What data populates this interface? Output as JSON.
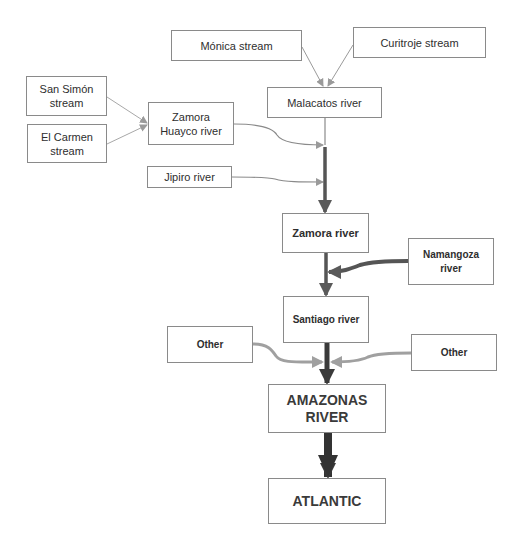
{
  "diagram": {
    "type": "flowchart",
    "title": "",
    "colors": {
      "box_border": "#8a8a8a",
      "thin_arrow": "#9a9a9a",
      "medium_arrow": "#5a5a5a",
      "dark_arrow": "#3a3a3a",
      "light_thick_arrow": "#a0a0a0",
      "text": "#2e2e2e"
    },
    "nodes": {
      "monica": {
        "label": "Mónica stream"
      },
      "curitroje": {
        "label": "Curitroje stream"
      },
      "malacatos": {
        "label": "Malacatos river"
      },
      "san_simon": {
        "label": "San Simón\nstream"
      },
      "el_carmen": {
        "label": "El Carmen\nstream"
      },
      "zamora_huayco": {
        "label": "Zamora\nHuayco river"
      },
      "jipiro": {
        "label": "Jipiro river"
      },
      "zamora": {
        "label": "Zamora river"
      },
      "namangoza": {
        "label": "Namangoza\nriver"
      },
      "santiago": {
        "label": "Santiago river"
      },
      "other_left": {
        "label": "Other"
      },
      "other_right": {
        "label": "Other"
      },
      "amazonas": {
        "label": "AMAZONAS\nRIVER"
      },
      "atlantic": {
        "label": "ATLANTIC"
      }
    },
    "edges": [
      {
        "from": "Mónica stream",
        "to": "Malacatos river",
        "weight": "thin"
      },
      {
        "from": "Curitroje stream",
        "to": "Malacatos river",
        "weight": "thin"
      },
      {
        "from": "San Simón stream",
        "to": "Zamora Huayco river",
        "weight": "thin"
      },
      {
        "from": "El Carmen stream",
        "to": "Zamora Huayco river",
        "weight": "thin"
      },
      {
        "from": "Zamora Huayco river",
        "to": "Malacatos river flow",
        "weight": "thin"
      },
      {
        "from": "Jipiro river",
        "to": "Malacatos river flow",
        "weight": "thin"
      },
      {
        "from": "Malacatos river",
        "to": "Zamora river",
        "weight": "medium"
      },
      {
        "from": "Zamora river",
        "to": "Santiago river",
        "weight": "medium"
      },
      {
        "from": "Namangoza river",
        "to": "Santiago river flow",
        "weight": "medium"
      },
      {
        "from": "Santiago river",
        "to": "AMAZONAS RIVER",
        "weight": "thick"
      },
      {
        "from": "Other (left)",
        "to": "AMAZONAS RIVER flow",
        "weight": "medium-light"
      },
      {
        "from": "Other (right)",
        "to": "AMAZONAS RIVER flow",
        "weight": "medium-light"
      },
      {
        "from": "AMAZONAS RIVER",
        "to": "ATLANTIC",
        "weight": "very-thick"
      }
    ]
  }
}
